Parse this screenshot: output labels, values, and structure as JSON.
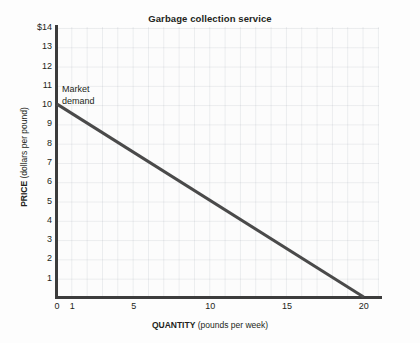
{
  "chart_data": {
    "type": "line",
    "title": "Garbage collection service",
    "xlabel_bold": "QUANTITY",
    "xlabel_rest": " (pounds per week)",
    "ylabel_bold": "PRICE",
    "ylabel_rest": " (dollars per pound)",
    "xlim": [
      0,
      21
    ],
    "ylim": [
      0,
      14
    ],
    "grid": true,
    "legend_position": "inline-annotation",
    "x_ticks": [
      {
        "value": 0,
        "label": "0"
      },
      {
        "value": 1,
        "label": "1"
      },
      {
        "value": 5,
        "label": "5"
      },
      {
        "value": 10,
        "label": "10"
      },
      {
        "value": 15,
        "label": "15"
      },
      {
        "value": 20,
        "label": "20"
      }
    ],
    "y_ticks": [
      {
        "value": 14,
        "label": "$14"
      },
      {
        "value": 13,
        "label": "13"
      },
      {
        "value": 12,
        "label": "12"
      },
      {
        "value": 11,
        "label": "11"
      },
      {
        "value": 10,
        "label": "10"
      },
      {
        "value": 9,
        "label": "9"
      },
      {
        "value": 8,
        "label": "8"
      },
      {
        "value": 7,
        "label": "7"
      },
      {
        "value": 6,
        "label": "6"
      },
      {
        "value": 5,
        "label": "5"
      },
      {
        "value": 4,
        "label": "4"
      },
      {
        "value": 3,
        "label": "3"
      },
      {
        "value": 2,
        "label": "2"
      },
      {
        "value": 1,
        "label": "1"
      }
    ],
    "series": [
      {
        "name": "Market demand",
        "annotation_line1": "Market",
        "annotation_line2": "demand",
        "color": "#4a4a4a",
        "line_width": 3,
        "points": [
          {
            "x": 0,
            "y": 10
          },
          {
            "x": 20,
            "y": 0
          }
        ]
      }
    ],
    "colors": {
      "line": "#4a4a4a",
      "axis": "#3c3c3c",
      "grid": "#d9dee3",
      "text": "#231f20",
      "plot_background": "#fcfcfc",
      "figure_background": "#fdfdfd"
    }
  }
}
